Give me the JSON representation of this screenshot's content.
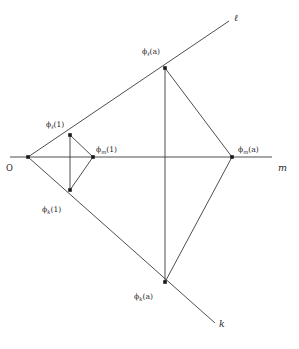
{
  "figure": {
    "background_color": "#ffffff",
    "line_color": "#3a3a3a",
    "node_color": "#1a1a1a",
    "text_color": "#1f1f1f",
    "width": 299,
    "height": 349
  },
  "origin": {
    "label": "O",
    "x": 28,
    "y": 157
  },
  "rays": [
    {
      "id": "ell",
      "label": "ℓ",
      "label_x": 234,
      "label_y": 21,
      "from_x": 28,
      "from_y": 157,
      "to_x": 229,
      "to_y": 21
    },
    {
      "id": "m",
      "label": "m",
      "label_x": 278,
      "label_y": 171,
      "from_x": 10,
      "from_y": 157,
      "to_x": 272,
      "to_y": 157
    },
    {
      "id": "k",
      "label": "k",
      "label_x": 219,
      "label_y": 327,
      "from_x": 28,
      "from_y": 157,
      "to_x": 215,
      "to_y": 323
    }
  ],
  "points": [
    {
      "id": "phi_ell_1",
      "label_main": "ϕ",
      "label_sub": "ℓ",
      "label_arg": "(1)",
      "x": 70,
      "y": 135,
      "label_x": 46,
      "label_y": 127,
      "on_ray": "ell"
    },
    {
      "id": "phi_m_1",
      "label_main": "ϕ",
      "label_sub": "m",
      "label_arg": "(1)",
      "x": 93,
      "y": 157,
      "label_x": 96,
      "label_y": 152,
      "on_ray": "m"
    },
    {
      "id": "phi_k_1",
      "label_main": "ϕ",
      "label_sub": "k",
      "label_arg": "(1)",
      "x": 70,
      "y": 190,
      "label_x": 42,
      "label_y": 212,
      "on_ray": "k"
    },
    {
      "id": "phi_ell_a",
      "label_main": "ϕ",
      "label_sub": "ℓ",
      "label_arg": "(a)",
      "x": 165,
      "y": 68,
      "label_x": 142,
      "label_y": 54,
      "on_ray": "ell"
    },
    {
      "id": "phi_m_a",
      "label_main": "ϕ",
      "label_sub": "m",
      "label_arg": "(a)",
      "x": 232,
      "y": 157,
      "label_x": 238,
      "label_y": 152,
      "on_ray": "m"
    },
    {
      "id": "phi_k_a",
      "label_main": "ϕ",
      "label_sub": "k",
      "label_arg": "(a)",
      "x": 165,
      "y": 282,
      "label_x": 134,
      "label_y": 299,
      "on_ray": "k"
    }
  ],
  "segments": [
    {
      "id": "inner-ell-m",
      "from": "phi_ell_1",
      "to": "phi_m_1"
    },
    {
      "id": "inner-m-k",
      "from": "phi_m_1",
      "to": "phi_k_1"
    },
    {
      "id": "inner-ell-k",
      "from": "phi_ell_1",
      "to": "phi_k_1"
    },
    {
      "id": "outer-ell-m",
      "from": "phi_ell_a",
      "to": "phi_m_a"
    },
    {
      "id": "outer-m-k",
      "from": "phi_m_a",
      "to": "phi_k_a"
    },
    {
      "id": "outer-ell-k",
      "from": "phi_ell_a",
      "to": "phi_k_a"
    }
  ]
}
